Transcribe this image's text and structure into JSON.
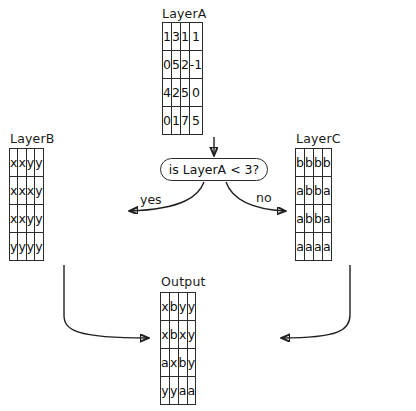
{
  "diagram": {
    "layer_a": {
      "label": "LayerA",
      "rows": [
        [
          "1",
          "3",
          "1",
          "1"
        ],
        [
          "0",
          "5",
          "2",
          "-1"
        ],
        [
          "4",
          "2",
          "5",
          "0"
        ],
        [
          "0",
          "1",
          "7",
          "5"
        ]
      ]
    },
    "layer_b": {
      "label": "LayerB",
      "rows": [
        [
          "x",
          "x",
          "y",
          "y"
        ],
        [
          "x",
          "x",
          "x",
          "y"
        ],
        [
          "x",
          "x",
          "y",
          "y"
        ],
        [
          "y",
          "y",
          "y",
          "y"
        ]
      ]
    },
    "layer_c": {
      "label": "LayerC",
      "rows": [
        [
          "b",
          "b",
          "b",
          "b"
        ],
        [
          "a",
          "b",
          "b",
          "a"
        ],
        [
          "a",
          "b",
          "b",
          "a"
        ],
        [
          "a",
          "a",
          "a",
          "a"
        ]
      ]
    },
    "output": {
      "label": "Output",
      "rows": [
        [
          "x",
          "b",
          "y",
          "y"
        ],
        [
          "x",
          "b",
          "x",
          "y"
        ],
        [
          "a",
          "x",
          "b",
          "y"
        ],
        [
          "y",
          "y",
          "a",
          "a"
        ]
      ]
    },
    "decision": {
      "text": "is LayerA < 3?"
    },
    "edges": {
      "yes_label": "yes",
      "no_label": "no"
    },
    "colors": {
      "stroke": "#202020",
      "cell_border": "#2b2b2b",
      "text": "#111111",
      "background": "#ffffff"
    }
  }
}
